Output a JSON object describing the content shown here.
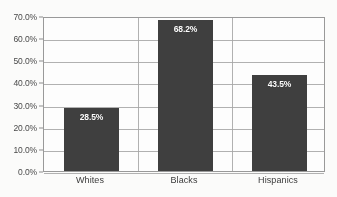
{
  "figure": {
    "title_remnant": "",
    "background_color": "#ffffff",
    "bar_color": "#3f3f3f",
    "gridline_color": "#a6a6a6",
    "axis_color": "#9a9a9a",
    "label_text_color": "#ffffff"
  },
  "chart_data": {
    "type": "bar",
    "title": "",
    "xlabel": "",
    "ylabel": "",
    "categories": [
      "Whites",
      "Blacks",
      "Hispanics"
    ],
    "values": [
      28.5,
      68.2,
      43.5
    ],
    "data_labels": [
      "28.5%",
      "68.2%",
      "43.5%"
    ],
    "ylim": [
      0,
      70
    ],
    "ytick_values": [
      0,
      10,
      20,
      30,
      40,
      50,
      60,
      70
    ],
    "ytick_labels": [
      "0.0%",
      "10.0%",
      "20.0%",
      "30.0%",
      "40.0%",
      "50.0%",
      "60.0%",
      "70.0%"
    ],
    "grid": true,
    "grid_axis": "both",
    "legend": false,
    "legend_position": "none",
    "series": [
      {
        "name": "Percent",
        "values": [
          28.5,
          68.2,
          43.5
        ]
      }
    ]
  }
}
